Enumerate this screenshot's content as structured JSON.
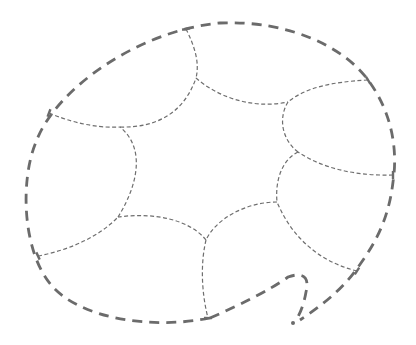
{
  "diagram": {
    "colors": {
      "outer_stroke": "#6b6b6b",
      "inner_stroke": "#6e6e6e",
      "background": "#ffffff"
    },
    "outer_boundary": {
      "path": "M 210 318 C 150 330 80 318 52 286 C 22 252 20 180 36 142 C 56 88 140 30 220 23 C 290 20 345 48 368 80 C 392 112 398 150 393 182 C 388 224 372 248 356 270 C 340 292 318 308 300 320",
      "hook_path": "M 210 318 C 240 305 270 290 288 277 C 302 272 310 276 306 292 C 304 304 300 314 296 320"
    },
    "end_dot": {
      "x": 293,
      "y": 323,
      "r": 2
    },
    "junctions_outer": [
      {
        "x": 49,
        "y": 113
      },
      {
        "x": 186,
        "y": 29
      },
      {
        "x": 368,
        "y": 80
      },
      {
        "x": 393,
        "y": 175
      },
      {
        "x": 357,
        "y": 271
      },
      {
        "x": 208,
        "y": 318
      },
      {
        "x": 38,
        "y": 256
      }
    ],
    "junctions_inner": [
      {
        "x": 120,
        "y": 127
      },
      {
        "x": 196,
        "y": 78
      },
      {
        "x": 288,
        "y": 102
      },
      {
        "x": 298,
        "y": 152
      },
      {
        "x": 277,
        "y": 202
      },
      {
        "x": 206,
        "y": 240
      },
      {
        "x": 118,
        "y": 217
      }
    ],
    "inner_edges": [
      {
        "name": "edge-upper-left-spoke",
        "path": "M 49 113 C 80 126 105 128 120 127"
      },
      {
        "name": "edge-top-spoke",
        "path": "M 186 29 C 194 45 200 62 196 78"
      },
      {
        "name": "edge-upper-right-spoke",
        "path": "M 368 80 C 330 82 305 88 288 102"
      },
      {
        "name": "edge-right-spoke",
        "path": "M 393 175 C 360 176 325 170 298 152"
      },
      {
        "name": "edge-lower-right-spoke",
        "path": "M 357 271 C 320 262 292 238 277 202"
      },
      {
        "name": "edge-bottom-spoke",
        "path": "M 206 240 C 200 265 202 295 208 318"
      },
      {
        "name": "edge-lower-left-spoke",
        "path": "M 38 256 C 70 250 100 236 118 217"
      },
      {
        "name": "edge-ring-1",
        "path": "M 120 127 C 160 128 185 110 196 78"
      },
      {
        "name": "edge-ring-2",
        "path": "M 196 78 C 215 95 250 110 288 102"
      },
      {
        "name": "edge-ring-3",
        "path": "M 288 102 C 278 118 282 140 298 152"
      },
      {
        "name": "edge-ring-4",
        "path": "M 298 152 C 282 160 275 180 277 202"
      },
      {
        "name": "edge-ring-5",
        "path": "M 277 202 C 245 202 215 220 206 240"
      },
      {
        "name": "edge-ring-6",
        "path": "M 206 240 C 190 220 155 212 118 217"
      },
      {
        "name": "edge-ring-7",
        "path": "M 118 217 C 135 190 148 150 120 127"
      }
    ]
  }
}
